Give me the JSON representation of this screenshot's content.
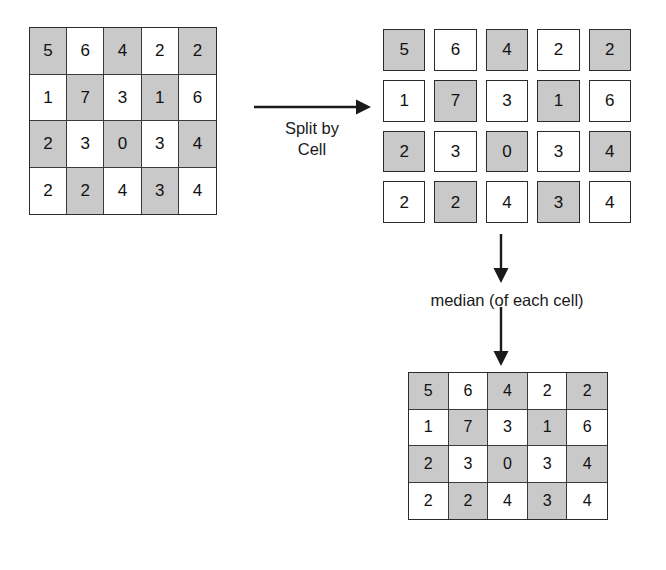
{
  "diagram": {
    "background_color": "#ffffff",
    "shaded_cell_color": "#c9c9c9",
    "plain_cell_color": "#ffffff",
    "border_color": "#2b2b2b",
    "text_color": "#111111"
  },
  "grids": {
    "source": {
      "name": "Source grid",
      "rows": 4,
      "cols": 5,
      "style": "joined",
      "values": [
        [
          "5",
          "6",
          "4",
          "2",
          "2"
        ],
        [
          "1",
          "7",
          "3",
          "1",
          "6"
        ],
        [
          "2",
          "3",
          "0",
          "3",
          "4"
        ],
        [
          "2",
          "2",
          "4",
          "3",
          "4"
        ]
      ],
      "shading": [
        [
          true,
          false,
          true,
          false,
          true
        ],
        [
          false,
          true,
          false,
          true,
          false
        ],
        [
          true,
          false,
          true,
          false,
          true
        ],
        [
          false,
          true,
          false,
          true,
          false
        ]
      ]
    },
    "split": {
      "name": "Split by cell grid",
      "rows": 4,
      "cols": 5,
      "style": "split",
      "values": [
        [
          "5",
          "6",
          "4",
          "2",
          "2"
        ],
        [
          "1",
          "7",
          "3",
          "1",
          "6"
        ],
        [
          "2",
          "3",
          "0",
          "3",
          "4"
        ],
        [
          "2",
          "2",
          "4",
          "3",
          "4"
        ]
      ],
      "shading": [
        [
          true,
          false,
          true,
          false,
          true
        ],
        [
          false,
          true,
          false,
          true,
          false
        ],
        [
          true,
          false,
          true,
          false,
          true
        ],
        [
          false,
          true,
          false,
          true,
          false
        ]
      ]
    },
    "result": {
      "name": "Median result grid",
      "rows": 4,
      "cols": 5,
      "style": "joined",
      "values": [
        [
          "5",
          "6",
          "4",
          "2",
          "2"
        ],
        [
          "1",
          "7",
          "3",
          "1",
          "6"
        ],
        [
          "2",
          "3",
          "0",
          "3",
          "4"
        ],
        [
          "2",
          "2",
          "4",
          "3",
          "4"
        ]
      ],
      "shading": [
        [
          true,
          false,
          true,
          false,
          true
        ],
        [
          false,
          true,
          false,
          true,
          false
        ],
        [
          true,
          false,
          true,
          false,
          true
        ],
        [
          false,
          true,
          false,
          true,
          false
        ]
      ]
    }
  },
  "labels": {
    "split_by_cell": "Split by\nCell",
    "median_of_each_cell": "median (of each cell)"
  },
  "arrows": {
    "split_arrow": "right-arrow-icon",
    "median_arrow_top": "down-arrow-icon",
    "median_arrow_bottom": "down-arrow-icon"
  }
}
